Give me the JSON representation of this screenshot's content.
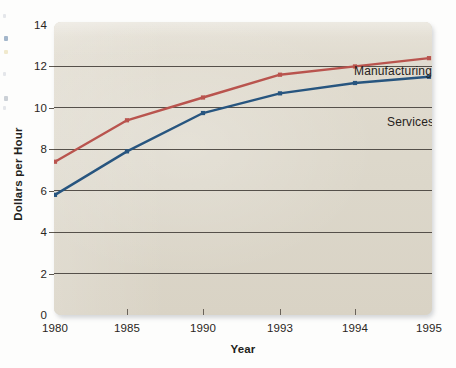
{
  "chart_data": {
    "type": "line",
    "title": "",
    "subtitle": "",
    "xlabel": "Year",
    "ylabel": "Dollars per Hour",
    "x": [
      1980,
      1985,
      1990,
      1993,
      1994,
      1995
    ],
    "categories": [
      "1980",
      "1985",
      "1990",
      "1993",
      "1994",
      "1995"
    ],
    "xtick_labels": [
      "1980",
      "1985",
      "1990",
      "1993",
      "1994",
      "1995"
    ],
    "ytick_labels": [
      "0",
      "2",
      "4",
      "6",
      "8",
      "10",
      "12",
      "14"
    ],
    "ytick_values": [
      0,
      2,
      4,
      6,
      8,
      10,
      12,
      14
    ],
    "ylim": [
      0,
      14
    ],
    "grid": "horizontal",
    "legend_position": "inline-annotations",
    "series": [
      {
        "name": "Manufacturing",
        "color": "#b9544e",
        "marker": "square-small",
        "values": [
          7.4,
          9.4,
          10.5,
          11.6,
          12.0,
          12.4
        ]
      },
      {
        "name": "Services",
        "color": "#27557f",
        "marker": "square-small",
        "values": [
          5.8,
          7.9,
          9.75,
          10.7,
          11.2,
          11.5
        ]
      }
    ],
    "annotations": [
      {
        "text": "Manufacturing",
        "series": "Manufacturing"
      },
      {
        "text": "Services",
        "series": "Services"
      }
    ]
  },
  "axes": {
    "x_title": "Year",
    "y_title": "Dollars per Hour",
    "y_ticks": [
      "14",
      "12",
      "10",
      "8",
      "6",
      "4",
      "2",
      "0"
    ],
    "x_ticks": [
      "1980",
      "1985",
      "1990",
      "1993",
      "1994",
      "1995"
    ]
  },
  "labels": {
    "manufacturing": "Manufacturing",
    "services": "Services"
  },
  "colors": {
    "manufacturing_line": "#b9544e",
    "services_line": "#27557f",
    "panel_background": "#ddd8cb",
    "gridline": "#55504a",
    "page_background": "#ffffff",
    "text": "#231f20"
  }
}
